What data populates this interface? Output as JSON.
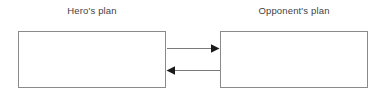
{
  "canvas": {
    "width": 386,
    "height": 97,
    "background_color": "#ffffff"
  },
  "diagram": {
    "type": "two-box-bidirectional-flow",
    "labels": {
      "hero": "Hero's plan",
      "opponent": "Opponent's plan"
    },
    "boxes": [
      {
        "id": "hero",
        "label": "Hero's plan",
        "x": 18,
        "y": 31,
        "width": 148,
        "height": 57,
        "fill": "#ffffff",
        "stroke": "#8a8a8a"
      },
      {
        "id": "opponent",
        "label": "Opponent's plan",
        "x": 220,
        "y": 31,
        "width": 148,
        "height": 57,
        "fill": "#ffffff",
        "stroke": "#8a8a8a"
      }
    ],
    "arrows": [
      {
        "id": "hero-to-opponent",
        "from": "hero",
        "to": "opponent",
        "direction": "right",
        "x1": 166,
        "x2": 220,
        "y": 48,
        "stroke": "#7a7a7a",
        "head_fill": "#1a1a1a"
      },
      {
        "id": "opponent-to-hero",
        "from": "opponent",
        "to": "hero",
        "direction": "left",
        "x1": 220,
        "x2": 166,
        "y": 70,
        "stroke": "#7a7a7a",
        "head_fill": "#1a1a1a"
      }
    ],
    "colors": {
      "text": "#3f3f3f",
      "box_stroke": "#8a8a8a",
      "line_stroke": "#7a7a7a",
      "arrow_head": "#1a1a1a",
      "background": "#ffffff"
    }
  }
}
